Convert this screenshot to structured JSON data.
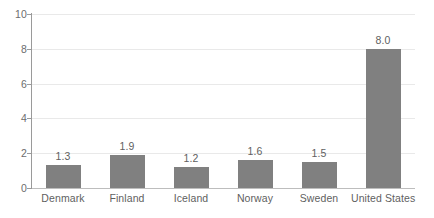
{
  "chart_data": {
    "type": "bar",
    "title": "",
    "subtitle": "",
    "xlabel": "",
    "ylabel": "",
    "ylim": [
      0,
      10
    ],
    "yticks": [
      "0",
      "2",
      "4",
      "6",
      "8",
      "10"
    ],
    "ytick_values": [
      0,
      2,
      4,
      6,
      8,
      10
    ],
    "grid": true,
    "legend": false,
    "legend_position": "none",
    "bar_color": "#808080",
    "gridline_color": "#e9e9e9",
    "axis_color": "#9a9a9a",
    "text_color": "#5f5f5f",
    "categories": [
      "Denmark",
      "Finland",
      "Iceland",
      "Norway",
      "Sweden",
      "United States"
    ],
    "values": [
      1.3,
      1.9,
      1.2,
      1.6,
      1.5,
      8.0
    ],
    "value_labels": [
      "1.3",
      "1.9",
      "1.2",
      "1.6",
      "1.5",
      "8.0"
    ]
  }
}
